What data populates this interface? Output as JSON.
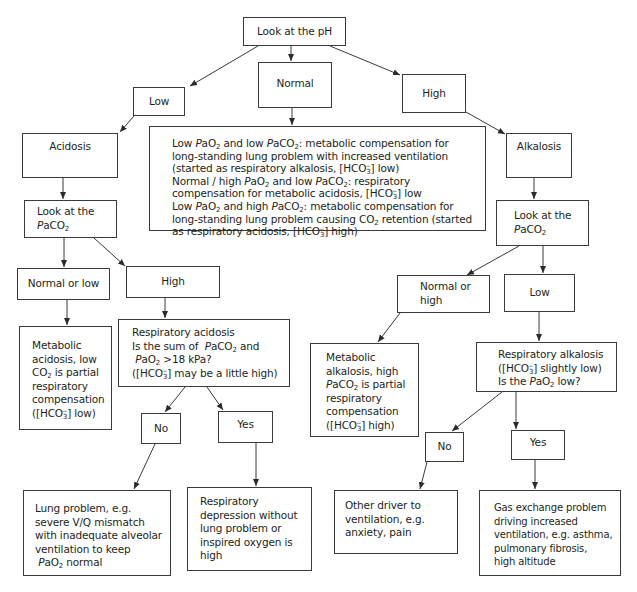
{
  "diagram": {
    "type": "flowchart",
    "nodes": {
      "root": {
        "label": "Look at the pH"
      },
      "ph_low": {
        "label": "Low"
      },
      "ph_normal": {
        "label": "Normal"
      },
      "ph_high": {
        "label": "High"
      },
      "normal_explanation": {
        "lines": [
          "Low PaO2 and low PaCO2: metabolic compensation for",
          "long-standing lung problem with increased ventilation",
          "(started as respiratory alkalosis, [HCO3-] low)",
          "Normal / high PaO2 and low PaCO2: respiratory",
          "compensation for metabolic acidosis, [HCO3-] low",
          "Low PaO2 and high PaCO2: metabolic compensation for",
          "long-standing lung problem causing CO2 retention (started",
          "as respiratory acidosis, [HCO3-] high)"
        ]
      },
      "acidosis": {
        "label": "Acidosis"
      },
      "alkalosis": {
        "label": "Alkalosis"
      },
      "acid_look_paco2": {
        "line1": "Look at the",
        "line2": "PaCO2"
      },
      "alk_look_paco2": {
        "line1": "Look at the",
        "line2": "PaCO2"
      },
      "acid_normal_or_low": {
        "label": "Normal or low"
      },
      "acid_high": {
        "label": "High"
      },
      "alk_normal_or_high": {
        "line1": "Normal or",
        "line2": "high"
      },
      "alk_low": {
        "label": "Low"
      },
      "metabolic_acidosis": {
        "lines": [
          "Metabolic",
          "acidosis, low",
          "CO2 is partial",
          "respiratory",
          "compensation",
          "([HCO3-] low)"
        ]
      },
      "respiratory_acidosis": {
        "lines": [
          "Respiratory acidosis",
          "Is the sum of  PaCO2 and",
          "PaO2 >18 kPa?",
          "([HCO3-] may be a little high)"
        ]
      },
      "metabolic_alkalosis": {
        "lines": [
          "Metabolic",
          "alkalosis, high",
          "PaCO2 is partial",
          "respiratory",
          "compensation",
          "([HCO3-] high)"
        ]
      },
      "respiratory_alkalosis": {
        "lines": [
          "Respiratory alkalosis",
          "([HCO3-] slightly low)",
          "Is the PaO2 low?"
        ]
      },
      "acid_no": {
        "label": "No"
      },
      "acid_yes": {
        "label": "Yes"
      },
      "alk_no": {
        "label": "No"
      },
      "alk_yes": {
        "label": "Yes"
      },
      "lung_problem": {
        "lines": [
          "Lung problem, e.g.",
          "severe V/Q mismatch",
          "with inadequate alveolar",
          "ventilation to keep",
          "PaO2 normal"
        ]
      },
      "respiratory_depression": {
        "lines": [
          "Respiratory",
          "depression without",
          "lung problem or",
          "inspired oxygen is",
          "high"
        ]
      },
      "other_driver": {
        "lines": [
          "Other driver to",
          "ventilation, e.g.",
          "anxiety, pain"
        ]
      },
      "gas_exchange": {
        "lines": [
          "Gas exchange problem",
          "driving increased",
          "ventilation, e.g. asthma,",
          "pulmonary fibrosis,",
          "high altitude"
        ]
      }
    },
    "edges": [
      [
        "root",
        "ph_low"
      ],
      [
        "root",
        "ph_normal"
      ],
      [
        "root",
        "ph_high"
      ],
      [
        "ph_low",
        "acidosis"
      ],
      [
        "ph_normal",
        "normal_explanation"
      ],
      [
        "ph_high",
        "alkalosis"
      ],
      [
        "acidosis",
        "acid_look_paco2"
      ],
      [
        "alkalosis",
        "alk_look_paco2"
      ],
      [
        "acid_look_paco2",
        "acid_normal_or_low"
      ],
      [
        "acid_look_paco2",
        "acid_high"
      ],
      [
        "alk_look_paco2",
        "alk_normal_or_high"
      ],
      [
        "alk_look_paco2",
        "alk_low"
      ],
      [
        "acid_normal_or_low",
        "metabolic_acidosis"
      ],
      [
        "acid_high",
        "respiratory_acidosis"
      ],
      [
        "alk_normal_or_high",
        "metabolic_alkalosis"
      ],
      [
        "alk_low",
        "respiratory_alkalosis"
      ],
      [
        "respiratory_acidosis",
        "acid_no"
      ],
      [
        "respiratory_acidosis",
        "acid_yes"
      ],
      [
        "respiratory_alkalosis",
        "alk_no"
      ],
      [
        "respiratory_alkalosis",
        "alk_yes"
      ],
      [
        "acid_no",
        "lung_problem"
      ],
      [
        "acid_yes",
        "respiratory_depression"
      ],
      [
        "alk_no",
        "other_driver"
      ],
      [
        "alk_yes",
        "gas_exchange"
      ]
    ],
    "colors": {
      "line": "#3a3a3a",
      "text": "#231f20",
      "background": "#ffffff"
    }
  }
}
